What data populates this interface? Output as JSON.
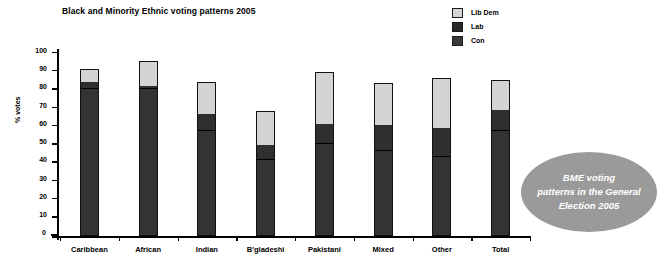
{
  "chart_data": {
    "type": "bar",
    "title": "Black and Minority Ethnic voting patterns 2005",
    "xlabel": "",
    "ylabel": "% votes",
    "ylim": [
      0,
      100
    ],
    "yticks": [
      0,
      10,
      20,
      30,
      40,
      50,
      60,
      70,
      80,
      90,
      100
    ],
    "grid": false,
    "stacked": true,
    "legend_position": "top-right",
    "categories": [
      "Caribbean",
      "African",
      "Indian",
      "B'gladeshi",
      "Pakistani",
      "Mixed",
      "Other",
      "Total"
    ],
    "series": [
      {
        "name": "Con",
        "color": "#333333",
        "values": [
          80,
          80,
          57,
          41,
          50,
          46,
          43,
          57
        ]
      },
      {
        "name": "Lab",
        "color": "#2f2f2f",
        "values": [
          3,
          1,
          9,
          8,
          10,
          14,
          15,
          11
        ]
      },
      {
        "name": "Lib Dem",
        "color": "#d4d4d4",
        "values": [
          7,
          13,
          17,
          18,
          28,
          22,
          27,
          16
        ]
      }
    ],
    "totals": [
      90,
      94,
      83,
      67,
      88,
      82,
      85,
      84
    ],
    "annotations": [
      {
        "text": "BME voting patterns in the General Election 2005",
        "shape": "ellipse",
        "fill": "#9a9a9a",
        "text_color": "#ffffff"
      }
    ]
  },
  "legend": {
    "items": [
      {
        "label": "Lib Dem",
        "color": "#d4d4d4"
      },
      {
        "label": "Lab",
        "color": "#2f2f2f"
      },
      {
        "label": "Con",
        "color": "#333333"
      }
    ]
  },
  "annotation": {
    "line1": "BME voting",
    "line2": "patterns in the General",
    "line3": "Election 2005"
  }
}
